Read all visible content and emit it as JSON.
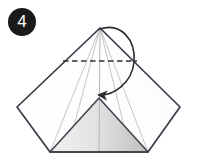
{
  "figure": {
    "kind": "origami-fold-step-diagram",
    "step_number": "4",
    "badge": {
      "shape": "circle",
      "fill_color": "#1a1a1a",
      "text_color": "#ffffff",
      "label": "4",
      "center_x": 22,
      "center_y": 22,
      "radius": 14
    },
    "canvas": {
      "width": 198,
      "height": 163,
      "background_color": "#ffffff"
    },
    "colors": {
      "outline": "#3b3b47",
      "crease_line": "#b4b4b4",
      "dashed_fold_line": "#2e2e33",
      "arrow": "#2b2b33",
      "shade_light": "#eeeeee",
      "shade_dark": "#c2c2c2",
      "paper_white": "#ffffff"
    },
    "geometry": {
      "apex": {
        "x": 100,
        "y": 28
      },
      "left_corner": {
        "x": 17,
        "y": 107
      },
      "right_corner": {
        "x": 180,
        "y": 107
      },
      "bottom_left": {
        "x": 50,
        "y": 152
      },
      "bottom_right": {
        "x": 148,
        "y": 152
      },
      "inner_apex": {
        "x": 99,
        "y": 98
      },
      "dashed_line": {
        "x1": 63,
        "y1": 61,
        "x2": 137,
        "y2": 61
      },
      "arrow_tip": {
        "x": 98,
        "y": 97
      }
    },
    "elements": [
      {
        "name": "outer-kite-outline",
        "description": "kite shaped paper silhouette with top apex, two side corners and flat bottom edge"
      },
      {
        "name": "shaded-inner-triangle",
        "description": "gray gradient filled triangle forming the front flap"
      },
      {
        "name": "dashed-fold-line",
        "description": "horizontal dashed valley fold line across the upper body"
      },
      {
        "name": "crease-lines",
        "description": "thin light gray crease lines radiating from the apex"
      },
      {
        "name": "fold-arrow",
        "description": "curved looping arrow from apex down to the inner apex showing fold direction"
      }
    ]
  }
}
